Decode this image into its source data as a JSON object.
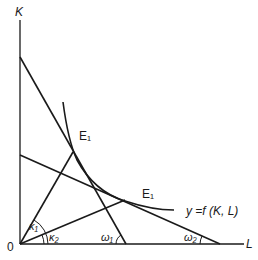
{
  "axes": {
    "y_label": "K",
    "x_label": "L",
    "origin_label": "0"
  },
  "points": {
    "e_upper": "E₁",
    "e_lower": "E₁"
  },
  "curve_label": "y =f  (K, L)",
  "angles": {
    "kappa1": "κ₁",
    "kappa2": "κ₂",
    "omega1": "ω₁",
    "omega2": "ω₂"
  },
  "colors": {
    "line": "#1a1a1a",
    "background": "#ffffff"
  }
}
